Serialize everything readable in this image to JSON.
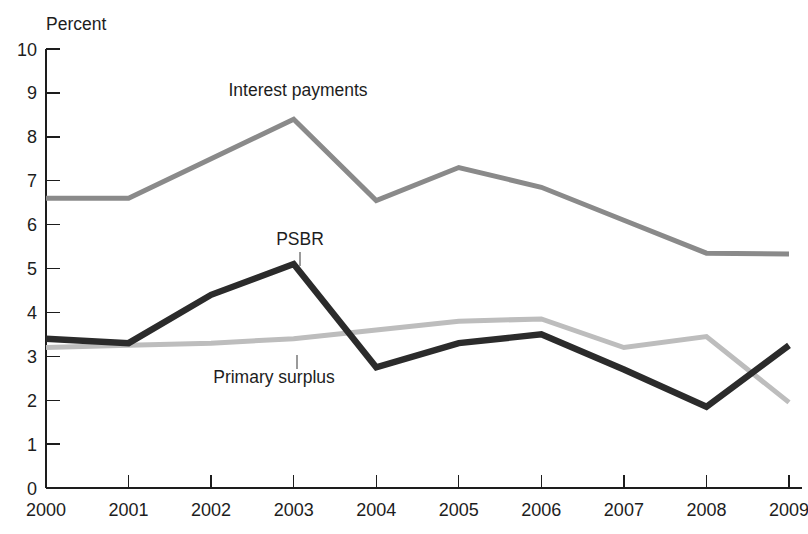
{
  "chart_data": {
    "type": "line",
    "title": "",
    "xlabel": "",
    "ylabel": "Percent",
    "ylim": [
      0,
      10
    ],
    "ytick_step": 1,
    "grid": false,
    "legend_position": "inline-labels",
    "categories": [
      "2000",
      "2001",
      "2002",
      "2003",
      "2004",
      "2005",
      "2006",
      "2007",
      "2008",
      "2009"
    ],
    "x": [
      2000,
      2001,
      2002,
      2003,
      2004,
      2005,
      2006,
      2007,
      2008,
      2009
    ],
    "yticks": [
      "0",
      "1",
      "2",
      "3",
      "4",
      "5",
      "6",
      "7",
      "8",
      "9",
      "10"
    ],
    "series": [
      {
        "name": "Interest payments",
        "color": "#8a8a8a",
        "width": 5.0,
        "values": [
          6.6,
          6.6,
          7.5,
          8.4,
          6.55,
          7.3,
          6.85,
          6.1,
          5.35,
          5.33
        ]
      },
      {
        "name": "PSBR",
        "color": "#2b2b2b",
        "width": 6.4,
        "values": [
          3.4,
          3.3,
          4.4,
          5.1,
          2.75,
          3.3,
          3.5,
          2.7,
          1.85,
          3.25
        ]
      },
      {
        "name": "Primary surplus",
        "color": "#bdbdbd",
        "width": 5.0,
        "values": [
          3.2,
          3.25,
          3.3,
          3.4,
          3.6,
          3.8,
          3.85,
          3.2,
          3.45,
          1.95
        ]
      }
    ],
    "annotations": [
      {
        "text": "Interest payments",
        "x_px": 298,
        "y_px": 96,
        "leader": null
      },
      {
        "text": "PSBR",
        "x_px": 300,
        "y_px": 245,
        "leader": {
          "x1": 300,
          "y1": 252,
          "x2": 300,
          "y2": 266
        }
      },
      {
        "text": "Primary surplus",
        "x_px": 274,
        "y_px": 383,
        "leader": {
          "x1": 297,
          "y1": 355,
          "x2": 297,
          "y2": 369
        }
      }
    ]
  },
  "axis": {
    "unit_label": "Percent"
  }
}
